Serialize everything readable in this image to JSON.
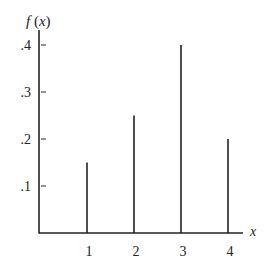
{
  "chart_data": {
    "type": "bar",
    "title": "",
    "xlabel": "x",
    "ylabel": "f(x)",
    "categories": [
      "1",
      "2",
      "3",
      "4"
    ],
    "values": [
      0.15,
      0.25,
      0.4,
      0.2
    ],
    "yticks": [
      ".1",
      ".2",
      ".3",
      ".4"
    ],
    "ylim": [
      0,
      0.43
    ],
    "grid": false,
    "style": "vertical spike lines (probability mass function)"
  },
  "labels": {
    "ylabel": "f (x)",
    "xlabel": "x"
  }
}
